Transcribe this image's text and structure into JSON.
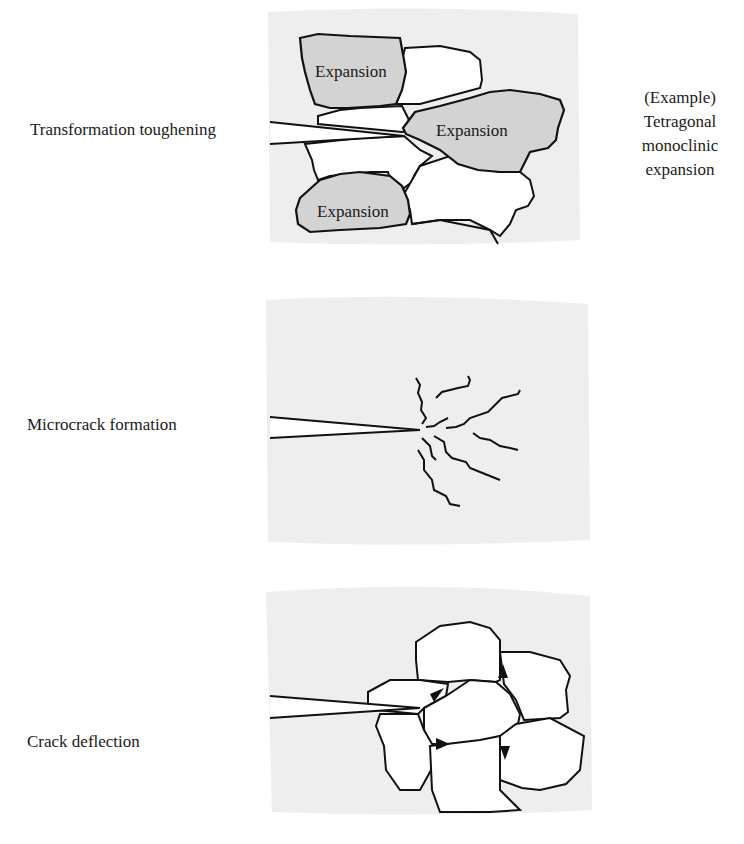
{
  "panels": [
    {
      "id": "transformation",
      "label": "Transformation toughening",
      "grain_labels": [
        "Expansion",
        "Expansion",
        "Expansion"
      ],
      "note_lines": [
        "(Example)",
        "Tetragonal",
        "monoclinic",
        "expansion"
      ]
    },
    {
      "id": "microcrack",
      "label": "Microcrack formation"
    },
    {
      "id": "deflection",
      "label": "Crack deflection"
    }
  ],
  "colors": {
    "panel_bg": "#eeeeee",
    "expansion_fill": "#d3d3d3",
    "grain_fill": "#ffffff",
    "line": "#111111"
  }
}
